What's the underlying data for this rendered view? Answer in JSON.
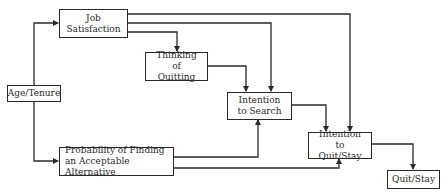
{
  "diagram": {
    "nodes": {
      "age_tenure": {
        "label": "Age/Tenure"
      },
      "job_satisfaction": {
        "label": "Job Satisfaction"
      },
      "thinking_of_quitting": {
        "label": "Thinking of Quitting"
      },
      "intention_to_search": {
        "label": "Intention to Search"
      },
      "probability_alternative": {
        "label": "Probability of Finding an Acceptable Alternative"
      },
      "intention_to_quit_stay": {
        "label": "Intention to Quit/Stay"
      },
      "quit_stay": {
        "label": "Quit/Stay"
      }
    },
    "edges": [
      {
        "from": "Age/Tenure",
        "to": "Job Satisfaction"
      },
      {
        "from": "Age/Tenure",
        "to": "Probability of Finding an Acceptable Alternative"
      },
      {
        "from": "Job Satisfaction",
        "to": "Thinking of Quitting"
      },
      {
        "from": "Job Satisfaction",
        "to": "Intention to Search"
      },
      {
        "from": "Job Satisfaction",
        "to": "Intention to Quit/Stay"
      },
      {
        "from": "Thinking of Quitting",
        "to": "Intention to Search"
      },
      {
        "from": "Probability of Finding an Acceptable Alternative",
        "to": "Intention to Search"
      },
      {
        "from": "Probability of Finding an Acceptable Alternative",
        "to": "Intention to Quit/Stay"
      },
      {
        "from": "Intention to Search",
        "to": "Intention to Quit/Stay"
      },
      {
        "from": "Intention to Quit/Stay",
        "to": "Quit/Stay"
      }
    ],
    "colors": {
      "line": "#2a2a2a",
      "background": "#ffffff"
    }
  }
}
